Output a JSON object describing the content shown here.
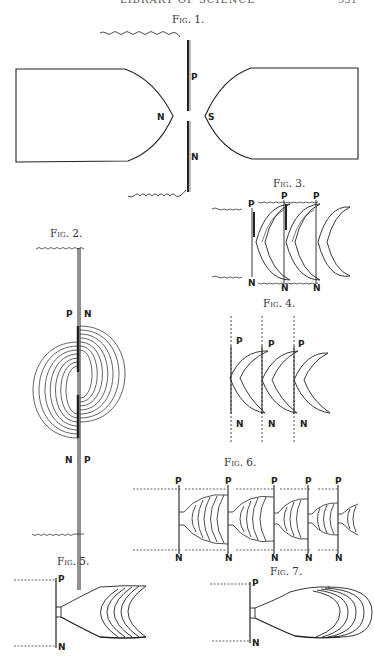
{
  "page": {
    "header_title": "LIBRARY OF SCIENCE",
    "header_page": "351"
  },
  "figures": [
    {
      "id": "fig1",
      "caption": "Fig. 1.",
      "labels": {
        "magnet_left": "N",
        "magnet_right": "S",
        "plate_upper": "P",
        "plate_lower": "N"
      }
    },
    {
      "id": "fig2",
      "caption": "Fig. 2.",
      "labels": {
        "upper_left": "P",
        "upper_right": "N",
        "lower_left": "N",
        "lower_right": "P"
      }
    },
    {
      "id": "fig3",
      "caption": "Fig. 3.",
      "labels": {
        "top": [
          "P",
          "P",
          "P"
        ],
        "bottom": [
          "N",
          "N",
          "N"
        ]
      }
    },
    {
      "id": "fig4",
      "caption": "Fig. 4.",
      "labels": {
        "top": [
          "P",
          "P",
          "P"
        ],
        "bottom": [
          "N",
          "N",
          "N"
        ]
      }
    },
    {
      "id": "fig5",
      "caption": "Fig. 5.",
      "labels": {
        "top": "P",
        "bottom": "N"
      }
    },
    {
      "id": "fig6",
      "caption": "Fig. 6.",
      "labels": {
        "top": [
          "P",
          "P",
          "P",
          "P",
          "P"
        ],
        "bottom": [
          "N",
          "N",
          "N",
          "N",
          "N"
        ]
      }
    },
    {
      "id": "fig7",
      "caption": "Fig. 7.",
      "labels": {
        "top": "P",
        "bottom": "N"
      }
    }
  ],
  "colors": {
    "ink": "#222222",
    "paper": "#ffffff"
  }
}
